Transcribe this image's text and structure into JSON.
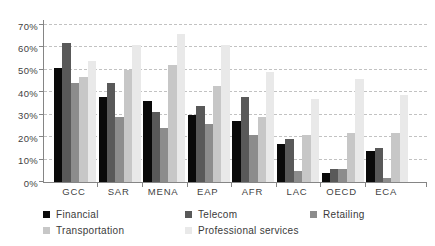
{
  "chart_data": {
    "type": "bar",
    "title": "",
    "xlabel": "",
    "ylabel": "",
    "categories": [
      "GCC",
      "SAR",
      "MENA",
      "EAP",
      "AFR",
      "LAC",
      "OECD",
      "ECA"
    ],
    "series": [
      {
        "name": "Financial",
        "color": "#0a0a0a",
        "values": [
          51,
          38,
          36,
          30,
          27,
          17,
          4,
          14
        ]
      },
      {
        "name": "Telecom",
        "color": "#595959",
        "values": [
          62,
          44,
          31,
          34,
          38,
          19,
          6,
          15
        ]
      },
      {
        "name": "Retailing",
        "color": "#8c8c8c",
        "values": [
          44,
          29,
          24,
          26,
          21,
          5,
          6,
          2
        ]
      },
      {
        "name": "Transportation",
        "color": "#c7c7c7",
        "values": [
          47,
          50,
          52,
          43,
          29,
          21,
          22,
          22
        ]
      },
      {
        "name": "Professional services",
        "color": "#e9e9e9",
        "values": [
          54,
          61,
          66,
          61,
          49,
          37,
          46,
          39
        ]
      }
    ],
    "ylim": [
      0,
      70
    ],
    "ytick_step": 10,
    "ytick_labels": [
      "0%",
      "10%",
      "20%",
      "30%",
      "40%",
      "50%",
      "60%",
      "70%"
    ],
    "grid": "horizontal-dashed",
    "legend_position": "bottom",
    "legend_rows": [
      [
        "Financial",
        "Telecom",
        "Retailing"
      ],
      [
        "Transportation",
        "Professional services"
      ]
    ],
    "background": "#ffffff"
  }
}
